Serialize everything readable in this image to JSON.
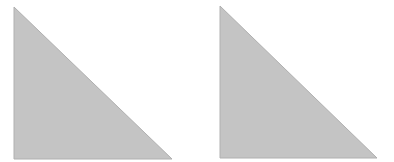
{
  "canvas": {
    "width": 394,
    "height": 162,
    "background": "#ffffff"
  },
  "shapes": [
    {
      "type": "right-triangle",
      "points": [
        [
          14,
          7
        ],
        [
          14,
          159
        ],
        [
          172,
          159
        ]
      ],
      "fill": "#c4c4c4",
      "stroke": "#b0b0b0"
    },
    {
      "type": "right-triangle",
      "points": [
        [
          220,
          6
        ],
        [
          220,
          158
        ],
        [
          377,
          158
        ]
      ],
      "fill": "#c4c4c4",
      "stroke": "#b0b0b0"
    }
  ]
}
